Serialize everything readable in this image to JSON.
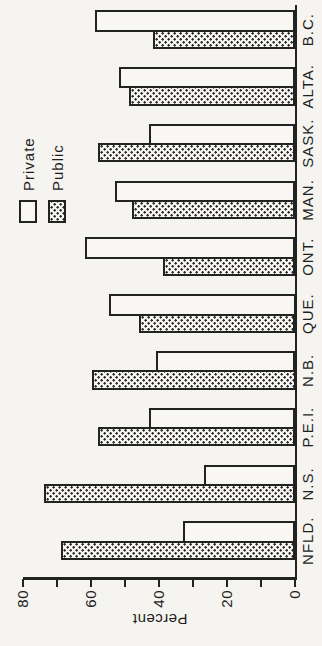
{
  "figure": {
    "paper_color": "#f5f4f0",
    "ink_color": "#222220",
    "rotation_note": "chart printed rotated 90deg counterclockwise on page"
  },
  "axis": {
    "label": "Percent",
    "tick_labels": [
      "0",
      "20",
      "40",
      "60",
      "80"
    ],
    "minor_tick_step": 10,
    "max": 80
  },
  "legend": {
    "items": [
      {
        "label": "Private",
        "swatch": "plain-outline-swatch"
      },
      {
        "label": "Public",
        "swatch": "stipple-dots-swatch"
      }
    ]
  },
  "chart_data": {
    "type": "bar",
    "title": "",
    "xlabel": "",
    "ylabel": "Percent",
    "ylim": [
      0,
      80
    ],
    "grid": false,
    "legend_position": "top-right-of-plot",
    "categories": [
      "NFLD.",
      "N.S.",
      "P.E.I.",
      "N.B.",
      "QUE.",
      "ONT.",
      "MAN.",
      "SASK.",
      "ALTA.",
      "B.C."
    ],
    "series": [
      {
        "name": "Private",
        "style": "plain",
        "values": [
          33,
          27,
          43,
          41,
          55,
          62,
          53,
          43,
          52,
          59
        ]
      },
      {
        "name": "Public",
        "style": "dots",
        "values": [
          69,
          74,
          58,
          60,
          46,
          39,
          48,
          58,
          49,
          42
        ]
      }
    ],
    "bar_order_within_group": [
      "Public",
      "Private"
    ]
  }
}
